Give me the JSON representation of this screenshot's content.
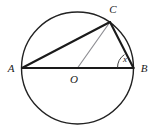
{
  "figure": {
    "type": "circle-geometry-diagram",
    "canvas": {
      "width": 155,
      "height": 135,
      "background": "#ffffff"
    },
    "colors": {
      "stroke_dark": "#1a1a1a",
      "stroke_thin": "#2b2b2b",
      "stroke_gray": "#8f8f94",
      "label": "#1a1a1a"
    },
    "circle": {
      "name": "circle-O",
      "cx": 77.5,
      "cy": 68,
      "r": 56,
      "stroke": "#222222",
      "stroke_width": 1.4,
      "fill": "none"
    },
    "points": [
      {
        "id": "A",
        "label": "A",
        "x": 22,
        "y": 68,
        "label_x": 11,
        "label_y": 68
      },
      {
        "id": "B",
        "label": "B",
        "x": 133.5,
        "y": 68,
        "label_x": 144,
        "label_y": 68
      },
      {
        "id": "C",
        "label": "C",
        "x": 110,
        "y": 22,
        "label_x": 113,
        "label_y": 9
      },
      {
        "id": "O",
        "label": "O",
        "x": 77.5,
        "y": 68,
        "label_x": 74,
        "label_y": 79
      }
    ],
    "segments": [
      {
        "name": "segment-AB",
        "from": "A",
        "to": "B",
        "x1": 22,
        "y1": 68,
        "x2": 133.5,
        "y2": 68,
        "stroke": "#1a1a1a",
        "stroke_width": 2.1
      },
      {
        "name": "segment-AC",
        "from": "A",
        "to": "C",
        "x1": 22,
        "y1": 68,
        "x2": 110,
        "y2": 22,
        "stroke": "#1a1a1a",
        "stroke_width": 2.1
      },
      {
        "name": "segment-CB",
        "from": "C",
        "to": "B",
        "x1": 110,
        "y1": 22,
        "x2": 133.5,
        "y2": 68,
        "stroke": "#1a1a1a",
        "stroke_width": 2.1
      },
      {
        "name": "segment-OC",
        "from": "O",
        "to": "C",
        "x1": 77.5,
        "y1": 68,
        "x2": 110,
        "y2": 22,
        "stroke": "#8f8f94",
        "stroke_width": 1.2
      }
    ],
    "angle": {
      "name": "angle-x-at-B",
      "label": "x",
      "vertex": "B",
      "between": [
        "BA",
        "BC"
      ],
      "arc_radius": 16,
      "arc_path": "M 117.5 68 A 16 16 0 0 1 124.42 54.62",
      "label_x": 125,
      "label_y": 59,
      "stroke": "#2b2b2b",
      "stroke_width": 0.9
    }
  }
}
